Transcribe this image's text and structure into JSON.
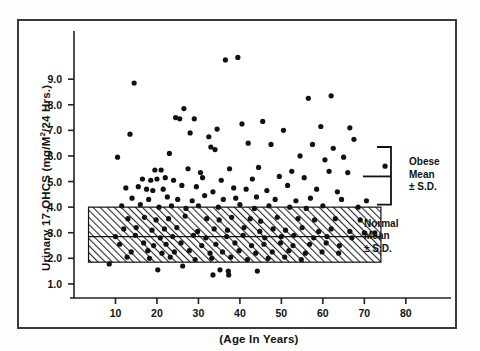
{
  "figure": {
    "name": "urinary-17-ohcs-scatter",
    "frame_color": "#3b3b3b",
    "background": "#ffffff",
    "point_color": "#111111",
    "band_fill": "#c8c8c8"
  },
  "chart_data": {
    "type": "scatter",
    "title": "",
    "xlabel": "(Age In Years)",
    "ylabel": "Urinary 17-OHCS (mg/M2/24 Hrs.)",
    "ylabel_prefix": "Urinary 17-OHCS (mg/M",
    "ylabel_sup": "2",
    "ylabel_suffix": "/24 Hrs.)",
    "xlim": [
      0,
      88
    ],
    "ylim": [
      0.45,
      10.1
    ],
    "grid": false,
    "legend": "none",
    "xticks": [
      10,
      20,
      30,
      40,
      50,
      60,
      70,
      80
    ],
    "xtick_labels": [
      "10",
      "20",
      "30",
      "40",
      "50",
      "60",
      "70",
      "80"
    ],
    "yticks": [
      1.0,
      2.0,
      3.0,
      4.0,
      5.0,
      6.0,
      7.0,
      8.0,
      9.0
    ],
    "ytick_labels": [
      "1.0",
      "2.0",
      "3.0",
      "4.0",
      "5.0",
      "6.0",
      "7.0",
      "8.0",
      "9.0"
    ],
    "bands": [
      {
        "name": "normal-range-band",
        "label": "Normal Mean ± S.D.",
        "x_start": 3.5,
        "x_end": 74.0,
        "y_low": 1.85,
        "y_high": 4.0,
        "mean": 2.85,
        "fill": "hatched",
        "fill_color": "#c8c8c8"
      }
    ],
    "brackets": [
      {
        "name": "obese-bracket",
        "label": "Obese Mean ± S.D.",
        "y_low": 4.1,
        "y_high": 6.35,
        "mean": 5.2
      }
    ],
    "annotations": [
      {
        "name": "obese-annotation",
        "lines": [
          "Obese",
          "Mean",
          "± S.D."
        ]
      },
      {
        "name": "normal-annotation",
        "lines": [
          "Normal",
          "Mean",
          "± S.D."
        ]
      }
    ],
    "points": [
      [
        36.5,
        9.75
      ],
      [
        39.5,
        9.85
      ],
      [
        14.5,
        8.85
      ],
      [
        56.5,
        8.25
      ],
      [
        62.0,
        8.35
      ],
      [
        26.5,
        7.85
      ],
      [
        45.5,
        7.35
      ],
      [
        59.5,
        7.15
      ],
      [
        66.5,
        7.1
      ],
      [
        24.5,
        7.5
      ],
      [
        25.5,
        7.45
      ],
      [
        29.0,
        7.45
      ],
      [
        34.5,
        7.05
      ],
      [
        40.5,
        7.25
      ],
      [
        13.5,
        6.85
      ],
      [
        28.0,
        6.9
      ],
      [
        50.5,
        7.0
      ],
      [
        67.5,
        6.65
      ],
      [
        32.5,
        6.75
      ],
      [
        33.0,
        6.35
      ],
      [
        42.0,
        6.5
      ],
      [
        47.5,
        6.45
      ],
      [
        57.5,
        6.45
      ],
      [
        62.5,
        6.3
      ],
      [
        10.5,
        5.95
      ],
      [
        23.0,
        6.1
      ],
      [
        34.0,
        6.25
      ],
      [
        54.5,
        6.0
      ],
      [
        60.5,
        5.85
      ],
      [
        65.0,
        5.95
      ],
      [
        19.5,
        5.45
      ],
      [
        21.0,
        5.45
      ],
      [
        27.5,
        5.5
      ],
      [
        30.5,
        5.35
      ],
      [
        37.5,
        5.5
      ],
      [
        44.5,
        5.55
      ],
      [
        52.5,
        5.4
      ],
      [
        61.5,
        5.4
      ],
      [
        66.0,
        5.35
      ],
      [
        75.0,
        5.6
      ],
      [
        16.5,
        5.1
      ],
      [
        18.5,
        5.05
      ],
      [
        20.0,
        5.1
      ],
      [
        22.0,
        5.15
      ],
      [
        24.0,
        5.05
      ],
      [
        31.0,
        5.15
      ],
      [
        35.5,
        5.05
      ],
      [
        43.0,
        5.1
      ],
      [
        49.5,
        5.2
      ],
      [
        55.5,
        5.15
      ],
      [
        12.5,
        4.75
      ],
      [
        15.5,
        4.8
      ],
      [
        17.5,
        4.7
      ],
      [
        19.0,
        4.65
      ],
      [
        21.5,
        4.7
      ],
      [
        26.0,
        4.85
      ],
      [
        29.5,
        4.8
      ],
      [
        33.5,
        4.6
      ],
      [
        38.5,
        4.75
      ],
      [
        41.5,
        4.7
      ],
      [
        46.5,
        4.65
      ],
      [
        51.5,
        4.85
      ],
      [
        58.5,
        4.7
      ],
      [
        63.5,
        4.6
      ],
      [
        14.0,
        4.35
      ],
      [
        18.0,
        4.3
      ],
      [
        22.5,
        4.4
      ],
      [
        25.0,
        4.3
      ],
      [
        28.5,
        4.25
      ],
      [
        31.5,
        4.45
      ],
      [
        36.0,
        4.3
      ],
      [
        39.0,
        4.35
      ],
      [
        44.0,
        4.4
      ],
      [
        48.5,
        4.3
      ],
      [
        53.5,
        4.25
      ],
      [
        57.0,
        4.35
      ],
      [
        64.5,
        4.3
      ],
      [
        70.5,
        4.25
      ],
      [
        11.5,
        4.05
      ],
      [
        16.0,
        4.1
      ],
      [
        20.5,
        4.0
      ],
      [
        23.5,
        4.05
      ],
      [
        27.0,
        3.95
      ],
      [
        30.0,
        4.05
      ],
      [
        34.8,
        4.0
      ],
      [
        40.0,
        4.1
      ],
      [
        43.5,
        3.95
      ],
      [
        47.0,
        4.05
      ],
      [
        52.0,
        4.0
      ],
      [
        56.0,
        3.95
      ],
      [
        60.0,
        4.05
      ],
      [
        68.5,
        4.0
      ],
      [
        13.0,
        3.55
      ],
      [
        17.0,
        3.6
      ],
      [
        19.8,
        3.5
      ],
      [
        22.8,
        3.55
      ],
      [
        26.8,
        3.65
      ],
      [
        32.0,
        3.55
      ],
      [
        35.0,
        3.5
      ],
      [
        38.0,
        3.6
      ],
      [
        42.5,
        3.55
      ],
      [
        45.0,
        3.45
      ],
      [
        49.0,
        3.6
      ],
      [
        54.0,
        3.55
      ],
      [
        58.0,
        3.5
      ],
      [
        63.0,
        3.55
      ],
      [
        69.0,
        3.5
      ],
      [
        12.0,
        3.15
      ],
      [
        15.0,
        3.2
      ],
      [
        18.8,
        3.1
      ],
      [
        21.8,
        3.15
      ],
      [
        24.8,
        3.2
      ],
      [
        29.8,
        3.05
      ],
      [
        33.8,
        3.15
      ],
      [
        37.0,
        3.1
      ],
      [
        41.0,
        3.2
      ],
      [
        44.8,
        3.05
      ],
      [
        48.0,
        3.15
      ],
      [
        51.0,
        3.1
      ],
      [
        55.0,
        3.2
      ],
      [
        59.0,
        3.05
      ],
      [
        62.0,
        3.15
      ],
      [
        66.5,
        3.05
      ],
      [
        70.0,
        3.0
      ],
      [
        72.5,
        3.0
      ],
      [
        10.0,
        2.85
      ],
      [
        14.8,
        2.9
      ],
      [
        20.8,
        2.8
      ],
      [
        23.8,
        2.85
      ],
      [
        28.8,
        2.9
      ],
      [
        31.8,
        2.8
      ],
      [
        36.8,
        2.85
      ],
      [
        40.8,
        2.9
      ],
      [
        46.0,
        2.8
      ],
      [
        50.0,
        2.85
      ],
      [
        53.0,
        2.9
      ],
      [
        57.8,
        2.8
      ],
      [
        61.0,
        2.85
      ],
      [
        67.0,
        2.8
      ],
      [
        11.0,
        2.55
      ],
      [
        16.8,
        2.6
      ],
      [
        19.2,
        2.5
      ],
      [
        22.2,
        2.55
      ],
      [
        25.8,
        2.6
      ],
      [
        30.8,
        2.5
      ],
      [
        34.2,
        2.55
      ],
      [
        38.8,
        2.6
      ],
      [
        42.8,
        2.5
      ],
      [
        45.8,
        2.55
      ],
      [
        49.8,
        2.6
      ],
      [
        52.8,
        2.5
      ],
      [
        56.8,
        2.55
      ],
      [
        60.8,
        2.6
      ],
      [
        64.0,
        2.5
      ],
      [
        13.8,
        2.25
      ],
      [
        17.8,
        2.3
      ],
      [
        21.2,
        2.2
      ],
      [
        24.2,
        2.25
      ],
      [
        27.8,
        2.3
      ],
      [
        32.8,
        2.2
      ],
      [
        35.8,
        2.25
      ],
      [
        39.8,
        2.3
      ],
      [
        43.8,
        2.2
      ],
      [
        47.8,
        2.25
      ],
      [
        51.8,
        2.3
      ],
      [
        55.8,
        2.2
      ],
      [
        59.8,
        2.25
      ],
      [
        63.8,
        2.2
      ],
      [
        12.8,
        2.05
      ],
      [
        18.2,
        2.0
      ],
      [
        23.2,
        2.05
      ],
      [
        29.2,
        1.95
      ],
      [
        33.2,
        2.0
      ],
      [
        37.8,
        2.05
      ],
      [
        41.8,
        1.95
      ],
      [
        46.8,
        2.0
      ],
      [
        50.8,
        2.05
      ],
      [
        54.8,
        1.95
      ],
      [
        8.5,
        1.78
      ],
      [
        20.2,
        1.55
      ],
      [
        26.2,
        1.7
      ],
      [
        33.5,
        1.35
      ],
      [
        35.2,
        1.55
      ],
      [
        37.2,
        1.5
      ],
      [
        37.3,
        1.35
      ],
      [
        44.2,
        1.5
      ]
    ]
  }
}
